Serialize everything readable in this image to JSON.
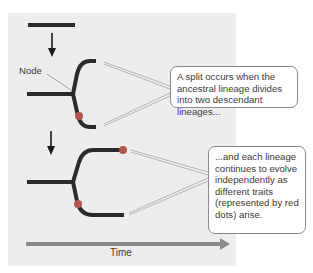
{
  "figure": {
    "node_label": "Node",
    "time_label": "Time",
    "callouts": [
      {
        "text": "A split occurs when the ancestral lineage divides into two descendant lineages..."
      },
      {
        "text": "...and each lineage continues to evolve independently as different traits (represented by red dots) arise."
      }
    ],
    "colors": {
      "panel": "#ededed",
      "lineage": "#2b2b2b",
      "trait_dot": "#b0564c",
      "time_arrow": "#8a8a8a",
      "leader_line": "#9a9a9a"
    },
    "stages": [
      {
        "name": "ancestral-lineage",
        "traits": 0
      },
      {
        "name": "split",
        "traits": 1
      },
      {
        "name": "independent-evolution",
        "traits": 2
      }
    ]
  }
}
